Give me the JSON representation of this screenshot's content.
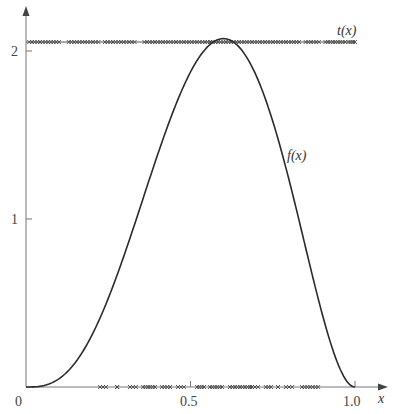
{
  "chart_data": {
    "type": "line",
    "title": "",
    "xlabel": "x",
    "ylabel": "",
    "xlim": [
      0,
      1.0
    ],
    "ylim": [
      0,
      2.2
    ],
    "grid": false,
    "x_ticks": [
      {
        "value": 0,
        "label": "0"
      },
      {
        "value": 0.5,
        "label": "0.5"
      },
      {
        "value": 1.0,
        "label": "1.0"
      }
    ],
    "y_ticks": [
      {
        "value": 1,
        "label": "1"
      },
      {
        "value": 2,
        "label": "2"
      }
    ],
    "series": [
      {
        "name": "f(x)",
        "label": "f(x)",
        "kind": "curve",
        "description": "density with mode ~0.6, peak ~2.07 (consistent with 60 x^3 (1-x)^2)",
        "x": [
          0,
          0.05,
          0.1,
          0.15,
          0.2,
          0.25,
          0.3,
          0.35,
          0.4,
          0.45,
          0.5,
          0.55,
          0.6,
          0.65,
          0.7,
          0.75,
          0.8,
          0.85,
          0.9,
          0.95,
          1.0
        ],
        "y": [
          0,
          0.007,
          0.049,
          0.145,
          0.307,
          0.527,
          0.794,
          1.093,
          1.382,
          1.64,
          1.875,
          2.002,
          2.074,
          2.06,
          1.852,
          1.582,
          1.229,
          0.829,
          0.437,
          0.129,
          0
        ]
      },
      {
        "name": "t(x)",
        "label": "t(x)",
        "kind": "constant-line-with-samples",
        "y_value": 2.07,
        "x_range": [
          0,
          1.0
        ],
        "sample_marker": "×",
        "sample_x_clusters": [
          [
            0.01,
            0.1
          ],
          [
            0.13,
            0.22
          ],
          [
            0.24,
            0.33
          ],
          [
            0.36,
            0.56
          ],
          [
            0.56,
            0.83
          ],
          [
            0.85,
            0.89
          ],
          [
            0.91,
            0.97
          ],
          [
            0.98,
            1.0
          ]
        ]
      },
      {
        "name": "accepted samples",
        "kind": "axis-samples",
        "y_value": 0,
        "sample_marker": "×",
        "sample_x_clusters": [
          [
            0.225,
            0.243
          ],
          [
            0.277,
            0.277
          ],
          [
            0.316,
            0.334
          ],
          [
            0.356,
            0.392
          ],
          [
            0.413,
            0.438
          ],
          [
            0.462,
            0.48
          ],
          [
            0.52,
            0.541
          ],
          [
            0.559,
            0.596
          ],
          [
            0.62,
            0.681
          ],
          [
            0.687,
            0.705
          ],
          [
            0.729,
            0.745
          ],
          [
            0.766,
            0.766
          ],
          [
            0.79,
            0.809
          ],
          [
            0.839,
            0.888
          ]
        ]
      }
    ],
    "annotations": [
      {
        "text": "t(x)",
        "x": 0.97,
        "y": 2.12
      },
      {
        "text": "f(x)",
        "x": 0.79,
        "y": 1.35
      }
    ]
  },
  "labels": {
    "x_axis": "x",
    "f_label": "f(x)",
    "t_label": "t(x)",
    "tick_x0": "0",
    "tick_x05": "0.5",
    "tick_x10": "1.0",
    "tick_y1": "1",
    "tick_y2": "2"
  },
  "colors": {
    "axis": "#777777",
    "curve": "#2a2a2a",
    "markers": "#444444"
  }
}
